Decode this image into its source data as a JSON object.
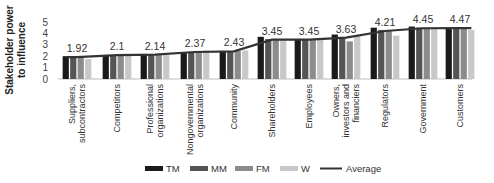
{
  "chart_data": {
    "type": "bar",
    "title": "",
    "xlabel": "",
    "ylabel": "Stakeholder power to influence",
    "ylabel_lines": [
      "Stakeholder power",
      "to influence"
    ],
    "ylim": [
      0,
      5
    ],
    "yticks": [
      0,
      1,
      2,
      3,
      4,
      5
    ],
    "grid": false,
    "legend_position": "bottom",
    "categories": [
      "Suppliers, subcontractors",
      "Competitors",
      "Professional organizations",
      "Nongovernmental organizations",
      "Community",
      "Shareholders",
      "Employees",
      "Owners, investors and financiers",
      "Regulators",
      "Government",
      "Customers"
    ],
    "category_lines": [
      [
        "Suppliers,",
        "subcontractors"
      ],
      [
        "Competitors"
      ],
      [
        "Professional",
        "organizations"
      ],
      [
        "Nongovernmental",
        "organizations"
      ],
      [
        "Community"
      ],
      [
        "Shareholders"
      ],
      [
        "Employees"
      ],
      [
        "Owners,",
        "investors and",
        "financiers"
      ],
      [
        "Regulators"
      ],
      [
        "Government"
      ],
      [
        "Customers"
      ]
    ],
    "series": [
      {
        "name": "TM",
        "type": "bar",
        "color": "#1a1a1a",
        "values": [
          2.0,
          2.1,
          2.2,
          2.35,
          2.4,
          3.7,
          3.5,
          3.9,
          4.5,
          4.6,
          4.5
        ]
      },
      {
        "name": "MM",
        "type": "bar",
        "color": "#555555",
        "values": [
          1.95,
          2.1,
          2.15,
          2.35,
          2.4,
          3.5,
          3.5,
          3.6,
          4.3,
          4.5,
          4.5
        ]
      },
      {
        "name": "FM",
        "type": "bar",
        "color": "#8c8c8c",
        "values": [
          1.9,
          2.1,
          2.1,
          2.3,
          2.45,
          3.45,
          3.5,
          3.3,
          4.3,
          4.4,
          4.45
        ]
      },
      {
        "name": "W",
        "type": "bar",
        "color": "#c8c8c8",
        "values": [
          1.75,
          2.1,
          2.1,
          2.5,
          2.5,
          3.45,
          3.45,
          3.8,
          3.8,
          4.4,
          4.3
        ]
      },
      {
        "name": "Average",
        "type": "line",
        "color": "#333333",
        "values": [
          1.92,
          2.1,
          2.14,
          2.37,
          2.43,
          3.45,
          3.45,
          3.63,
          4.21,
          4.45,
          4.47
        ]
      }
    ],
    "data_labels": [
      "1.92",
      "2.1",
      "2.14",
      "2.37",
      "2.43",
      "3.45",
      "3.45",
      "3.63",
      "4.21",
      "4.45",
      "4.47"
    ]
  },
  "legend": [
    {
      "label": "TM",
      "kind": "bar",
      "color": "#1a1a1a"
    },
    {
      "label": "MM",
      "kind": "bar",
      "color": "#555555"
    },
    {
      "label": "FM",
      "kind": "bar",
      "color": "#8c8c8c"
    },
    {
      "label": "W",
      "kind": "bar",
      "color": "#c8c8c8"
    },
    {
      "label": "Average",
      "kind": "line",
      "color": "#333333"
    }
  ]
}
